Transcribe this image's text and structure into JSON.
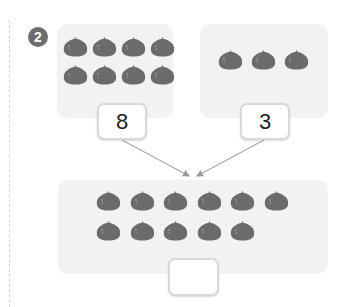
{
  "problem": {
    "number": "2",
    "badge_color": "#6d6d6d",
    "panel_color": "#f2f2f2",
    "fruit_color": "#6b6b6b"
  },
  "left_group": {
    "count": 8,
    "label": "8",
    "rows": [
      4,
      4
    ]
  },
  "right_group": {
    "count": 3,
    "label": "3",
    "rows": [
      3
    ]
  },
  "total_group": {
    "count": 11,
    "rows": [
      6,
      5
    ],
    "answer": ""
  },
  "icons": {
    "fruit": "fruit-icon",
    "arrow": "arrow-icon"
  }
}
